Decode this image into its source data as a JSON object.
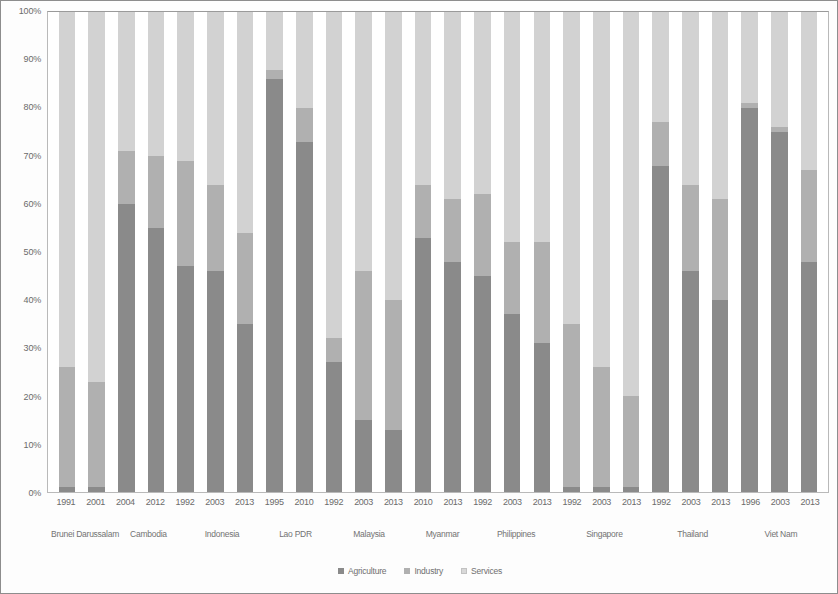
{
  "chart_data": {
    "type": "bar",
    "stacked": true,
    "stack_mode": "percent",
    "title": "",
    "subtitle": "",
    "xlabel": "",
    "ylabel": "",
    "ylim": [
      0,
      100
    ],
    "yticks": [
      "0%",
      "10%",
      "20%",
      "30%",
      "40%",
      "50%",
      "60%",
      "70%",
      "80%",
      "90%",
      "100%"
    ],
    "grid": false,
    "legend_position": "bottom",
    "legend": [
      "Agriculture",
      "Industry",
      "Services"
    ],
    "colors": {
      "agriculture": "#8a8a8a",
      "industry": "#b0b0b0",
      "services": "#d2d2d2",
      "frame": "#b9b9b9",
      "text": "#6b6b6b"
    },
    "categories": [
      "1991",
      "2001",
      "2004",
      "2012",
      "1992",
      "2003",
      "2013",
      "1995",
      "2010",
      "1992",
      "2003",
      "2013",
      "2010",
      "2013",
      "1992",
      "2003",
      "2013",
      "1992",
      "2003",
      "2013",
      "1992",
      "2003",
      "2013",
      "1996",
      "2003",
      "2013"
    ],
    "groups": [
      {
        "country": "Brunei Darussalam",
        "years": [
          "1991",
          "2001"
        ]
      },
      {
        "country": "Cambodia",
        "years": [
          "2004",
          "2012"
        ]
      },
      {
        "country": "Indonesia",
        "years": [
          "1992",
          "2003",
          "2013"
        ]
      },
      {
        "country": "Lao PDR",
        "years": [
          "1995",
          "2010"
        ]
      },
      {
        "country": "Malaysia",
        "years": [
          "1992",
          "2003",
          "2013"
        ]
      },
      {
        "country": "Myanmar",
        "years": [
          "2010",
          "2013"
        ]
      },
      {
        "country": "Philippines",
        "years": [
          "1992",
          "2003",
          "2013"
        ]
      },
      {
        "country": "Singapore",
        "years": [
          "1992",
          "2003",
          "2013"
        ]
      },
      {
        "country": "Thailand",
        "years": [
          "1992",
          "2003",
          "2013"
        ]
      },
      {
        "country": "Viet Nam",
        "years": [
          "1996",
          "2003",
          "2013"
        ]
      }
    ],
    "series": [
      {
        "name": "Agriculture",
        "color": "#8a8a8a",
        "values": [
          1,
          1,
          60,
          55,
          47,
          46,
          35,
          86,
          73,
          27,
          15,
          13,
          53,
          48,
          45,
          37,
          31,
          1,
          1,
          1,
          68,
          46,
          40,
          80,
          75,
          48
        ]
      },
      {
        "name": "Industry",
        "color": "#b0b0b0",
        "values": [
          25,
          22,
          11,
          15,
          22,
          18,
          19,
          2,
          7,
          5,
          31,
          27,
          11,
          13,
          17,
          15,
          21,
          34,
          25,
          19,
          9,
          18,
          21,
          1,
          1,
          19
        ]
      },
      {
        "name": "Services",
        "color": "#d2d2d2",
        "values": [
          74,
          77,
          29,
          30,
          31,
          36,
          46,
          12,
          20,
          68,
          54,
          60,
          36,
          39,
          38,
          48,
          48,
          65,
          74,
          80,
          23,
          36,
          39,
          19,
          24,
          33
        ]
      }
    ],
    "bars": [
      {
        "country": "Brunei Darussalam",
        "year": "1991",
        "agriculture": 1,
        "industry": 25,
        "services": 74
      },
      {
        "country": "Brunei Darussalam",
        "year": "2001",
        "agriculture": 1,
        "industry": 22,
        "services": 77
      },
      {
        "country": "Cambodia",
        "year": "2004",
        "agriculture": 60,
        "industry": 11,
        "services": 29
      },
      {
        "country": "Cambodia",
        "year": "2012",
        "agriculture": 55,
        "industry": 15,
        "services": 30
      },
      {
        "country": "Indonesia",
        "year": "1992",
        "agriculture": 47,
        "industry": 22,
        "services": 31
      },
      {
        "country": "Indonesia",
        "year": "2003",
        "agriculture": 46,
        "industry": 18,
        "services": 36
      },
      {
        "country": "Indonesia",
        "year": "2013",
        "agriculture": 35,
        "industry": 19,
        "services": 46
      },
      {
        "country": "Lao PDR",
        "year": "1995",
        "agriculture": 86,
        "industry": 2,
        "services": 12
      },
      {
        "country": "Lao PDR",
        "year": "2010",
        "agriculture": 73,
        "industry": 7,
        "services": 20
      },
      {
        "country": "Malaysia",
        "year": "1992",
        "agriculture": 27,
        "industry": 5,
        "services": 68
      },
      {
        "country": "Malaysia",
        "year": "2003",
        "agriculture": 15,
        "industry": 31,
        "services": 54
      },
      {
        "country": "Malaysia",
        "year": "2013",
        "agriculture": 13,
        "industry": 27,
        "services": 60
      },
      {
        "country": "Myanmar",
        "year": "2010",
        "agriculture": 53,
        "industry": 11,
        "services": 36
      },
      {
        "country": "Myanmar",
        "year": "2013",
        "agriculture": 48,
        "industry": 13,
        "services": 39
      },
      {
        "country": "Philippines",
        "year": "1992",
        "agriculture": 45,
        "industry": 17,
        "services": 38
      },
      {
        "country": "Philippines",
        "year": "2003",
        "agriculture": 37,
        "industry": 15,
        "services": 48
      },
      {
        "country": "Philippines",
        "year": "2013",
        "agriculture": 31,
        "industry": 21,
        "services": 48
      },
      {
        "country": "Singapore",
        "year": "1992",
        "agriculture": 1,
        "industry": 34,
        "services": 65
      },
      {
        "country": "Singapore",
        "year": "2003",
        "agriculture": 1,
        "industry": 25,
        "services": 74
      },
      {
        "country": "Singapore",
        "year": "2013",
        "agriculture": 1,
        "industry": 19,
        "services": 80
      },
      {
        "country": "Thailand",
        "year": "1992",
        "agriculture": 68,
        "industry": 9,
        "services": 23
      },
      {
        "country": "Thailand",
        "year": "2003",
        "agriculture": 46,
        "industry": 18,
        "services": 36
      },
      {
        "country": "Thailand",
        "year": "2013",
        "agriculture": 40,
        "industry": 21,
        "services": 39
      },
      {
        "country": "Viet Nam",
        "year": "1996",
        "agriculture": 80,
        "industry": 1,
        "services": 19
      },
      {
        "country": "Viet Nam",
        "year": "2003",
        "agriculture": 75,
        "industry": 1,
        "services": 24
      },
      {
        "country": "Viet Nam",
        "year": "2013",
        "agriculture": 48,
        "industry": 19,
        "services": 33
      }
    ]
  }
}
